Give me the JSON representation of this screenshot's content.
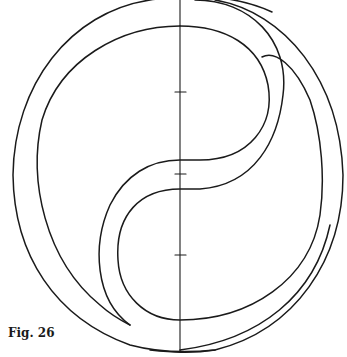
{
  "figure": {
    "caption": "Fig. 26",
    "stroke_color": "#1a1a1a",
    "background_color": "#ffffff"
  }
}
